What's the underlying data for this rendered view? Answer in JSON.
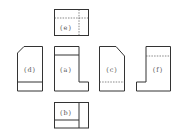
{
  "diagram": {
    "type": "orthographic-views",
    "views": [
      {
        "id": "e",
        "label": "(e)",
        "position": "top"
      },
      {
        "id": "d",
        "label": "(d)",
        "position": "left"
      },
      {
        "id": "a",
        "label": "(a)",
        "position": "front"
      },
      {
        "id": "c",
        "label": "(c)",
        "position": "right"
      },
      {
        "id": "f",
        "label": "(f)",
        "position": "rear"
      },
      {
        "id": "b",
        "label": "(b)",
        "position": "bottom"
      }
    ],
    "colors": {
      "line": "#333333",
      "hidden_line": "#555555",
      "background": "#ffffff"
    }
  }
}
